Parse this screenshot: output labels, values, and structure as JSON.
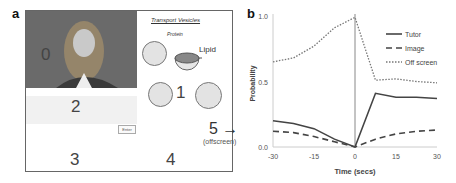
{
  "panel_a": {
    "label": "a",
    "regions": {
      "video": "0",
      "whiteboard": "1",
      "text_band": "2",
      "lower_left": "3",
      "lower_middle": "4",
      "offscreen": "5 →",
      "offscreen_note": "(offscreen)"
    },
    "whiteboard": {
      "title": "Transport Vesicles",
      "protein_label": "Protein",
      "lipid_label": "Lipid"
    },
    "enter_button": "Enter"
  },
  "panel_b": {
    "label": "b"
  },
  "chart_data": {
    "type": "line",
    "title": "",
    "xlabel": "Time (secs)",
    "ylabel": "Probability",
    "x": [
      -30,
      -22.5,
      -15,
      -7.5,
      0,
      7.5,
      15,
      22.5,
      30
    ],
    "xticks": [
      "-30",
      "-15",
      "0",
      "15",
      "30"
    ],
    "yticks": [
      "0.0",
      "0.5",
      "1.0"
    ],
    "xlim": [
      -30,
      30
    ],
    "ylim": [
      0,
      1.0
    ],
    "grid": false,
    "vertical_marker_x": 0,
    "legend_position": "upper right",
    "series": [
      {
        "name": "Tutor",
        "style": "solid",
        "values": [
          0.2,
          0.18,
          0.14,
          0.06,
          0.0,
          0.41,
          0.38,
          0.38,
          0.37
        ]
      },
      {
        "name": "Image",
        "style": "dashed",
        "values": [
          0.12,
          0.11,
          0.08,
          0.04,
          0.0,
          0.06,
          0.1,
          0.12,
          0.13
        ]
      },
      {
        "name": "Off screen",
        "style": "dotted",
        "values": [
          0.65,
          0.68,
          0.77,
          0.91,
          0.99,
          0.51,
          0.52,
          0.5,
          0.49
        ]
      }
    ]
  }
}
